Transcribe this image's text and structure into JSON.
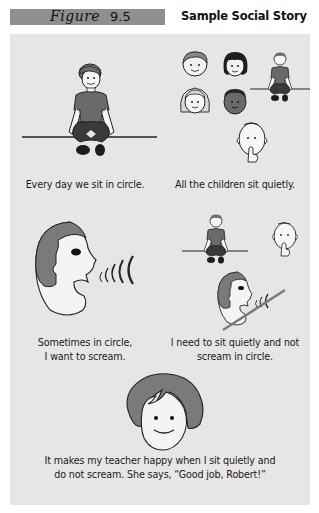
{
  "figure": {
    "label_word": "Figure",
    "label_number": "9.5",
    "title": "Sample Social Story",
    "label_bar_color": "#8f8f8f",
    "panel_color": "#e6e6e6"
  },
  "story": {
    "panels": [
      {
        "caption": "Every day we sit in circle.",
        "illustration": "boy-sitting-cross-legged-icon"
      },
      {
        "caption": "All the children sit quietly.",
        "illustration": "children-faces-boy-sitting-shush-face-icon"
      },
      {
        "caption_line1": "Sometimes in circle,",
        "caption_line2": "I want to scream.",
        "illustration": "screaming-head-icon"
      },
      {
        "caption_line1": "I need to sit quietly and not",
        "caption_line2": "scream in circle.",
        "illustration": "sit-quietly-no-scream-icon"
      },
      {
        "caption_line1": "It makes my teacher happy when I sit quietly and",
        "caption_line2": "do not scream. She says, “Good job, Robert!”",
        "illustration": "smiling-teacher-face-icon"
      }
    ]
  }
}
